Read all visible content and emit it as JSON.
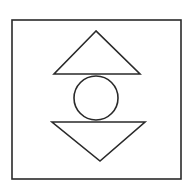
{
  "diagram": {
    "stroke_color": "#2a2a2a",
    "background": "#ffffff",
    "frame": {
      "x": 12,
      "y": 20,
      "width": 169,
      "height": 159
    },
    "upper_triangle": {
      "points": "96,31 54,74 140,74"
    },
    "circle": {
      "cx": 96,
      "cy": 98,
      "r": 22
    },
    "lower_triangle": {
      "points": "52,122 145,122 100,161"
    }
  }
}
